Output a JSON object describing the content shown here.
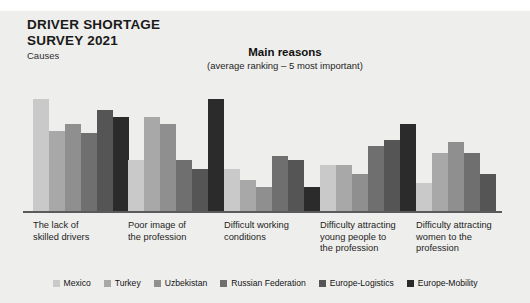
{
  "header": {
    "title_line1": "DRIVER SHORTAGE",
    "title_line2": "SURVEY 2021",
    "subtitle": "Causes"
  },
  "chart_title": "Main reasons",
  "chart_subtitle": "(average ranking – 5 most important)",
  "colors": {
    "panel_background": "#eeeeec",
    "axis": "#5a5a5a",
    "series": [
      "#c9c9c9",
      "#a8a8a8",
      "#8f8f8f",
      "#6f6f6f",
      "#555555",
      "#2b2b2b"
    ]
  },
  "chart_data": {
    "type": "bar",
    "title": "Main reasons",
    "subtitle": "(average ranking – 5 most important)",
    "xlabel": "",
    "ylabel": "Average ranking",
    "ylim": [
      0,
      5
    ],
    "grid": false,
    "legend_position": "bottom",
    "categories": [
      "The lack of skilled drivers",
      "Poor image of the profession",
      "Difficult working conditions",
      "Difficulty attracting young people to the profession",
      "Difficulty attracting women to the profession"
    ],
    "category_labels_wrapped": [
      [
        "The lack of",
        "skilled drivers"
      ],
      [
        "Poor image of",
        "the profession"
      ],
      [
        "Difficult working",
        "conditions"
      ],
      [
        "Difficulty attracting",
        "young people to",
        "the profession"
      ],
      [
        "Difficulty attracting",
        "women to the",
        "profession"
      ]
    ],
    "series": [
      {
        "name": "Mexico",
        "color": "#c9c9c9",
        "values": [
          5.0,
          2.3,
          1.9,
          2.1,
          1.3
        ]
      },
      {
        "name": "Turkey",
        "color": "#a8a8a8",
        "values": [
          3.6,
          4.2,
          1.4,
          2.1,
          2.6
        ]
      },
      {
        "name": "Uzbekistan",
        "color": "#8f8f8f",
        "values": [
          3.9,
          3.9,
          1.1,
          1.7,
          3.1
        ]
      },
      {
        "name": "Russian Federation",
        "color": "#6f6f6f",
        "values": [
          3.5,
          2.3,
          2.5,
          2.9,
          2.6
        ]
      },
      {
        "name": "Europe-Logistics",
        "color": "#555555",
        "values": [
          4.5,
          1.9,
          2.3,
          3.2,
          1.7
        ]
      },
      {
        "name": "Europe-Mobility",
        "color": "#2b2b2b",
        "values": [
          4.2,
          5.0,
          1.1,
          3.9,
          0.0
        ]
      }
    ]
  }
}
